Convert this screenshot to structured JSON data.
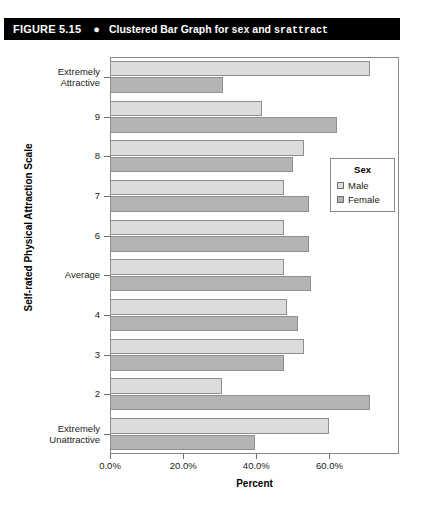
{
  "figure": {
    "number": "FIGURE 5.15",
    "bullet": "●",
    "title_part1": "Clustered Bar Graph for ",
    "title_var1": "sex",
    "title_part2": " and ",
    "title_var2": "srattract"
  },
  "legend": {
    "title": "Sex",
    "entries": [
      {
        "label": "Male",
        "color": "#dcdcdc"
      },
      {
        "label": "Female",
        "color": "#b4b4b4"
      }
    ]
  },
  "chart_data": {
    "type": "bar",
    "orientation": "horizontal",
    "title": "Clustered Bar Graph for sex and srattract",
    "xlabel": "Percent",
    "ylabel": "Self-rated Physical Attraction Scale",
    "xlim": [
      0,
      79
    ],
    "xticks": [
      0,
      20,
      40,
      60
    ],
    "xticklabels": [
      "0.0%",
      "20.0%",
      "40.0%",
      "60.0%"
    ],
    "grid": false,
    "legend_position": "right-inside",
    "categories": [
      "Extremely\nAttractive",
      "9",
      "8",
      "7",
      "6",
      "Average",
      "4",
      "3",
      "2",
      "Extremely\nUnattractive"
    ],
    "category_labels": [
      {
        "line1": "Extremely",
        "line2": "Attractive"
      },
      {
        "line1": "9",
        "line2": ""
      },
      {
        "line1": "8",
        "line2": ""
      },
      {
        "line1": "7",
        "line2": ""
      },
      {
        "line1": "6",
        "line2": ""
      },
      {
        "line1": "Average",
        "line2": ""
      },
      {
        "line1": "4",
        "line2": ""
      },
      {
        "line1": "3",
        "line2": ""
      },
      {
        "line1": "2",
        "line2": ""
      },
      {
        "line1": "Extremely",
        "line2": "Unattractive"
      }
    ],
    "series": [
      {
        "name": "Male",
        "color": "#dcdcdc",
        "values": [
          71.0,
          41.5,
          53.0,
          47.5,
          47.5,
          47.5,
          48.5,
          53.0,
          30.5,
          60.0
        ]
      },
      {
        "name": "Female",
        "color": "#b4b4b4",
        "values": [
          31.0,
          62.0,
          50.0,
          54.5,
          54.5,
          55.0,
          51.5,
          47.5,
          71.0,
          39.5
        ]
      }
    ]
  }
}
